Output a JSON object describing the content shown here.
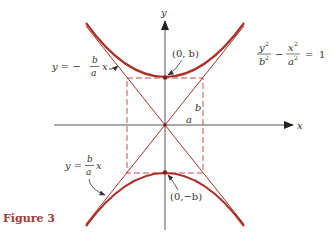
{
  "figure": {
    "caption": "Figure 3",
    "colors": {
      "curve": "#a8332d",
      "asymptote": "#a8332d",
      "box": "#c0504a",
      "axis": "#444444",
      "caption": "#a03a3a"
    },
    "axes": {
      "x_label": "x",
      "y_label": "y"
    },
    "equation": {
      "term1_num": "y",
      "term1_num_exp": "2",
      "term1_den": "b",
      "term1_den_exp": "2",
      "minus": "−",
      "term2_num": "x",
      "term2_num_exp": "2",
      "term2_den": "a",
      "term2_den_exp": "2",
      "equals": "=",
      "rhs": "1"
    },
    "vertices": {
      "top": "(0, b)",
      "bottom": "(0,−b)"
    },
    "asymptotes": {
      "negative": {
        "lhs": "y = −",
        "num": "b",
        "den": "a",
        "var": "x"
      },
      "positive": {
        "lhs": "y =",
        "num": "b",
        "den": "a",
        "var": "x"
      }
    },
    "box_labels": {
      "half_height": "b",
      "half_width": "a"
    }
  }
}
